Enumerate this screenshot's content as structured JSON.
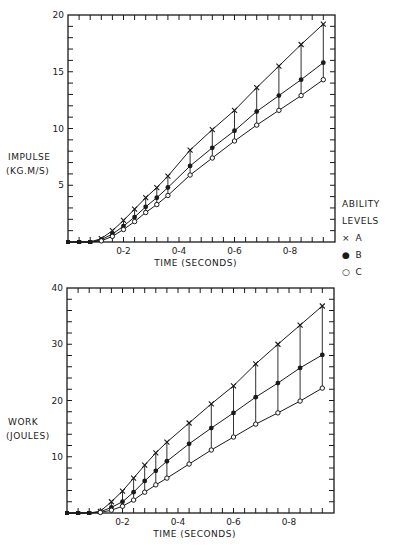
{
  "chart_data": [
    {
      "type": "line",
      "title": "",
      "xlabel": "TIME (SECONDS)",
      "ylabel": "IMPULSE (KG.M/S)",
      "ylim": [
        0,
        20
      ],
      "xlim": [
        0,
        0.96
      ],
      "xticks": [
        "0-2",
        "0-4",
        "0-6",
        "0-8"
      ],
      "yticks": [
        "5",
        "10",
        "15",
        "20"
      ],
      "grid": false,
      "error_bars": "vertical lines connecting A to C at each time point",
      "x": [
        0,
        0.04,
        0.08,
        0.12,
        0.16,
        0.2,
        0.24,
        0.28,
        0.32,
        0.36,
        0.44,
        0.52,
        0.6,
        0.68,
        0.76,
        0.84,
        0.92
      ],
      "series": [
        {
          "name": "A",
          "marker": "x",
          "values": [
            0,
            0,
            0,
            0.3,
            1.0,
            1.9,
            2.9,
            3.9,
            4.8,
            5.8,
            8.1,
            9.9,
            11.6,
            13.6,
            15.5,
            17.4,
            19.2
          ]
        },
        {
          "name": "B",
          "marker": "filled-circle",
          "values": [
            0,
            0,
            0,
            0.2,
            0.7,
            1.4,
            2.2,
            3.1,
            3.9,
            4.8,
            6.7,
            8.3,
            9.8,
            11.5,
            12.9,
            14.3,
            15.8
          ]
        },
        {
          "name": "C",
          "marker": "open-circle",
          "values": [
            0,
            0,
            0,
            0.1,
            0.5,
            1.1,
            1.8,
            2.6,
            3.3,
            4.1,
            5.9,
            7.4,
            8.9,
            10.3,
            11.6,
            12.9,
            14.3
          ]
        }
      ]
    },
    {
      "type": "line",
      "title": "",
      "xlabel": "TIME (SECONDS)",
      "ylabel": "WORK (JOULES)",
      "ylim": [
        0,
        40
      ],
      "xlim": [
        0,
        0.96
      ],
      "xticks": [
        "0-2",
        "0-4",
        "0-6",
        "0-8"
      ],
      "yticks": [
        "10",
        "20",
        "30",
        "40"
      ],
      "grid": false,
      "error_bars": "vertical lines connecting A to C at each time point",
      "x": [
        0,
        0.04,
        0.08,
        0.12,
        0.16,
        0.2,
        0.24,
        0.28,
        0.32,
        0.36,
        0.44,
        0.52,
        0.6,
        0.68,
        0.76,
        0.84,
        0.92
      ],
      "series": [
        {
          "name": "A",
          "marker": "x",
          "values": [
            0,
            0,
            0,
            0.3,
            2.0,
            3.9,
            6.2,
            8.5,
            10.7,
            12.6,
            16.0,
            19.4,
            22.6,
            26.5,
            30.0,
            33.4,
            36.8
          ]
        },
        {
          "name": "B",
          "marker": "filled-circle",
          "values": [
            0,
            0,
            0,
            0.2,
            1.0,
            2.0,
            3.7,
            5.7,
            7.5,
            9.2,
            12.3,
            15.1,
            17.8,
            20.6,
            23.1,
            25.8,
            28.1
          ]
        },
        {
          "name": "C",
          "marker": "open-circle",
          "values": [
            0,
            0,
            0,
            0.1,
            0.5,
            1.2,
            2.3,
            3.7,
            5.0,
            6.2,
            8.7,
            11.2,
            13.5,
            15.8,
            17.8,
            19.9,
            22.2
          ]
        }
      ]
    }
  ],
  "top_chart": {
    "ylabel_line1": "IMPULSE",
    "ylabel_line2": "(KG.M/S)",
    "xlabel": "TIME  (SECONDS)"
  },
  "bottom_chart": {
    "ylabel_line1": "WORK",
    "ylabel_line2": "(JOULES)",
    "xlabel": "TIME  (SECONDS)"
  },
  "legend": {
    "title_line1": "ABILITY",
    "title_line2": "LEVELS",
    "items": [
      {
        "marker": "×",
        "label": "A"
      },
      {
        "marker": "●",
        "label": "B"
      },
      {
        "marker": "○",
        "label": "C"
      }
    ]
  }
}
